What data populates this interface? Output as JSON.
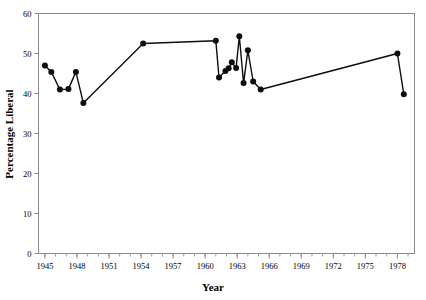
{
  "chart_data": {
    "type": "line",
    "title": "",
    "xlabel": "Year",
    "ylabel": "Percentage Liberal",
    "xlim": [
      1944.4,
      1979.6
    ],
    "ylim": [
      0,
      60
    ],
    "grid": false,
    "legend": null,
    "x_ticks": [
      1945,
      1948,
      1951,
      1954,
      1957,
      1960,
      1963,
      1966,
      1969,
      1972,
      1975,
      1978
    ],
    "x_tick_labels": [
      "1945",
      "1948",
      "1951",
      "1954",
      "1957",
      "1960",
      "1963",
      "1966",
      "1969",
      "1972",
      "1975",
      "1978"
    ],
    "x_minor_tick_interval": 1,
    "y_ticks": [
      0,
      10,
      20,
      30,
      40,
      50,
      60
    ],
    "y_tick_labels": [
      "0",
      "10",
      "20",
      "30",
      "40",
      "50",
      "60"
    ],
    "marker": "filled-circle",
    "marker_size": 3,
    "line_color": "#0d0d0d",
    "series": [
      {
        "name": "Percentage Liberal",
        "x": [
          1945.0,
          1945.6,
          1946.4,
          1947.2,
          1947.9,
          1948.6,
          1954.2,
          1961.0,
          1961.3,
          1961.9,
          1962.2,
          1962.5,
          1962.9,
          1963.2,
          1963.6,
          1964.0,
          1964.5,
          1965.2,
          1978.0,
          1978.6
        ],
        "y": [
          47.0,
          45.4,
          41.0,
          41.1,
          45.4,
          37.6,
          52.5,
          53.2,
          44.0,
          45.6,
          46.3,
          47.8,
          46.4,
          54.3,
          42.6,
          50.8,
          43.0,
          41.0,
          50.0,
          39.8
        ]
      }
    ]
  },
  "axes": {
    "x_axis_title": "Year",
    "y_axis_title": "Percentage Liberal"
  }
}
